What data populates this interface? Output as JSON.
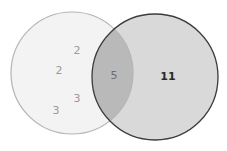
{
  "diagram": {
    "type": "venn",
    "sets": [
      {
        "name": "left-set",
        "fill": "#f3f3f3",
        "stroke": "#b4b4b4"
      },
      {
        "name": "right-set",
        "fill": "#d9d9d9",
        "stroke": "#3c3c3c"
      }
    ],
    "intersection_fill": "#b9b9b9",
    "left_only_values": [
      "2",
      "2",
      "3",
      "3"
    ],
    "intersection_value": "5",
    "right_only_value": "11"
  }
}
